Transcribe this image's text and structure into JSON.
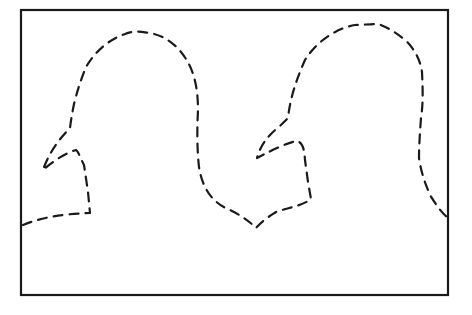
{
  "figure": {
    "width": 472,
    "height": 315,
    "background": "#ffffff",
    "stroke_color": "#1a1a1a",
    "frame": {
      "x": 21,
      "y": 10,
      "width": 192,
      "height": 285,
      "right": 448,
      "bottom": 295,
      "stroke_width": 2.2
    },
    "outline": {
      "stroke_width": 2.2,
      "dash": "9 7",
      "path": "M 23 225 C 40 218 60 214 90 213 L 88 192 L 84 165 C 80 157 78 151 76 150 C 65 153 52 162 43 170 C 48 155 58 140 70 128 C 71 120 72 114 74 104 C 78 88 82 77 86 67 C 96 50 110 39 125 34 C 134 30 142 32 150 33 C 166 36 178 46 186 59 C 195 73 198 91 198 110 C 197 129 197 149 199 167 C 203 192 215 204 230 210 C 240 215 248 220 256 228 C 263 220 270 216 276 212 C 290 207 302 206 311 199 L 308 182 L 305 160 C 304 146 302 143 297 141 C 290 142 276 148 257 158 C 260 147 266 137 280 126 L 288 118 C 290 99 296 80 305 60 C 315 44 333 29 355 25 C 362 25 370 24 378 24 C 387 27 395 32 405 40 C 414 48 420 59 422 72 C 423 93 423 105 421 118 C 420 132 419 145 419 158 C 421 172 425 183 430 195 C 436 205 442 213 448 218"
    },
    "shapes": [
      {
        "name": "left-hook",
        "top_y": 33,
        "beak_tip": [
          43,
          170
        ],
        "notch": [
          90,
          213
        ]
      },
      {
        "name": "right-hook",
        "top_y": 24,
        "beak_tip": [
          257,
          158
        ],
        "notch": [
          311,
          199
        ],
        "valley": [
          256,
          228
        ]
      }
    ]
  }
}
